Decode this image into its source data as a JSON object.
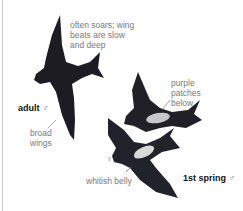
{
  "illustration": {
    "subject": "Purple Martin field-guide plate",
    "annotations": {
      "flight": "often soars; wing\nbeats are slow\nand deep",
      "wings": "broad\nwings",
      "patches": "purple\npatches\nbelow",
      "belly": "whitish belly"
    },
    "labels": {
      "adult": "adult",
      "adult_sex": "♂",
      "female_symbol": "♀",
      "first_spring": "1st spring",
      "first_spring_sex": "♂"
    },
    "colors": {
      "bird_dark": "#1c1c22",
      "belly_light": "#d8d8d8",
      "text_note": "#7a7a7a",
      "text_label": "#111111"
    }
  }
}
